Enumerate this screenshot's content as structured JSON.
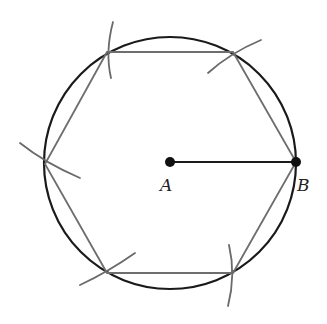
{
  "figure": {
    "colors": {
      "circle": "#1a1a1a",
      "hexagon": "#6e6e6e",
      "arcs": "#6a6a6a",
      "radius": "#1a1a1a",
      "points": "#111111"
    },
    "circle": {
      "cx": 170,
      "cy": 163,
      "r": 126
    },
    "points": [
      {
        "id": "A",
        "label": "A",
        "x": 170,
        "y": 162,
        "label_x": 160,
        "label_y": 191
      },
      {
        "id": "B",
        "label": "B",
        "x": 296,
        "y": 162,
        "label_x": 297,
        "label_y": 191
      }
    ],
    "radius_segment": {
      "from": "A",
      "to": "B"
    },
    "hexagon_vertices": [
      {
        "x": 296,
        "y": 162
      },
      {
        "x": 233,
        "y": 52
      },
      {
        "x": 107,
        "y": 52
      },
      {
        "x": 45,
        "y": 164
      },
      {
        "x": 107,
        "y": 273
      },
      {
        "x": 233,
        "y": 273
      }
    ],
    "compass_arcs": [
      {
        "vertex": "upper-right",
        "path": "M 208 73 Q 230 53 261 40"
      },
      {
        "vertex": "upper-left",
        "path": "M 113 22 Q 105 52 111 78"
      },
      {
        "vertex": "left",
        "path": "M 20 143 Q 45 163 80 178"
      },
      {
        "vertex": "lower-left",
        "path": "M 80 285 Q 108 272 135 253"
      },
      {
        "vertex": "lower-right",
        "path": "M 229 245 Q 236 275 228 306"
      }
    ]
  }
}
